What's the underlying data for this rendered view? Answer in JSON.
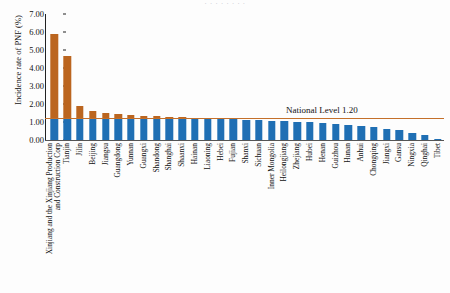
{
  "top_clipped_text": "· · · · · · · ·",
  "axis": {
    "ylabel": "Incidence rate of PNF (%)",
    "yticks": [
      "7.00",
      "6.00",
      "5.00",
      "4.00",
      "3.00",
      "2.00",
      "1.00",
      "0.00"
    ],
    "ymin": 0,
    "ymax": 7
  },
  "reference": {
    "label": "National Level 1.20",
    "value": 1.2,
    "color": "#c4702a"
  },
  "colors": {
    "above_national": "#bb651f",
    "below_national": "#1f6fb4",
    "axis": "#222222"
  },
  "chart_data": {
    "type": "bar",
    "title": "",
    "xlabel": "",
    "ylabel": "Incidence rate of PNF (%)",
    "ylim": [
      0,
      7
    ],
    "ytick_step": 1,
    "grid": false,
    "legend": "none",
    "reference_line": {
      "label": "National Level 1.20",
      "value": 1.2
    },
    "categories": [
      "Xinjiang and the Xinjiang Production and Construction Corp",
      "Tianjin",
      "Jilin",
      "Beijing",
      "Jiangsu",
      "Guangdong",
      "Yunnan",
      "Guangxi",
      "Shandong",
      "Shanghai",
      "Shaanxi",
      "Hainan",
      "Liaoning",
      "Hebei",
      "Fujian",
      "Shanxi",
      "Sichuan",
      "Inner Mongolia",
      "Heilongjiang",
      "Zhejiang",
      "Hubei",
      "Henan",
      "Guizhou",
      "Hunan",
      "Anhui",
      "Chongqing",
      "Jiangxi",
      "Gansu",
      "Ningxia",
      "Qinghai",
      "Tibet"
    ],
    "values": [
      5.88,
      4.68,
      1.88,
      1.6,
      1.48,
      1.42,
      1.38,
      1.36,
      1.34,
      1.3,
      1.28,
      1.24,
      1.2,
      1.18,
      1.16,
      1.12,
      1.1,
      1.08,
      1.06,
      1.02,
      1.0,
      0.94,
      0.9,
      0.84,
      0.76,
      0.7,
      0.62,
      0.58,
      0.4,
      0.3,
      0.06
    ]
  }
}
